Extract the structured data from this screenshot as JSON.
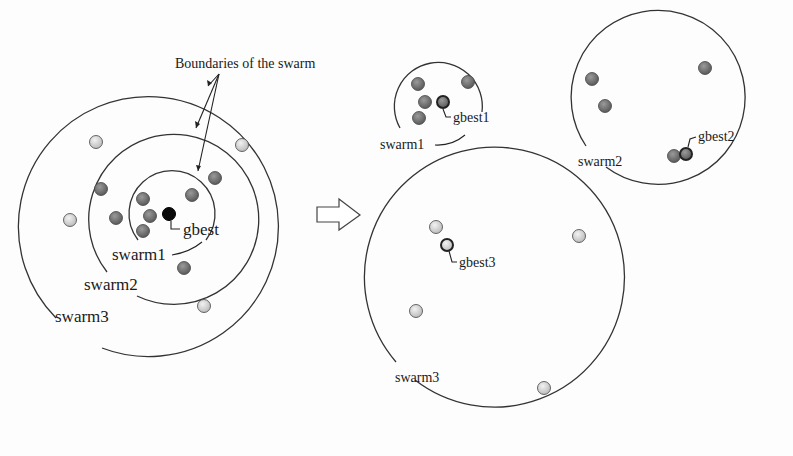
{
  "figure": {
    "colors": {
      "swarm1_particle": "#6e6e6e",
      "swarm2_particle": "#7a7a7a",
      "swarm3_particle": "#d4d4d4",
      "gbest": "#0a0a0a",
      "line": "#333333"
    },
    "left": {
      "annotation": "Boundaries of the swarm",
      "gbest_label": "gbest",
      "rings": [
        {
          "name": "swarm1",
          "label": "swarm1",
          "cx": 165,
          "cy": 215,
          "r": 43
        },
        {
          "name": "swarm2",
          "label": "swarm2",
          "cx": 165,
          "cy": 225,
          "r": 85
        },
        {
          "name": "swarm3",
          "label": "swarm3",
          "cx": 165,
          "cy": 235,
          "r": 130
        }
      ],
      "particles": [
        {
          "swarm": "swarm1",
          "x": 143,
          "y": 199
        },
        {
          "swarm": "swarm1",
          "x": 150,
          "y": 216
        },
        {
          "swarm": "swarm1",
          "x": 143,
          "y": 231
        },
        {
          "swarm": "swarm1",
          "x": 192,
          "y": 195
        },
        {
          "swarm": "swarm2",
          "x": 101,
          "y": 189
        },
        {
          "swarm": "swarm2",
          "x": 116,
          "y": 218
        },
        {
          "swarm": "swarm2",
          "x": 215,
          "y": 178
        },
        {
          "swarm": "swarm2",
          "x": 184,
          "y": 268
        },
        {
          "swarm": "swarm3",
          "x": 96,
          "y": 142
        },
        {
          "swarm": "swarm3",
          "x": 242,
          "y": 145
        },
        {
          "swarm": "swarm3",
          "x": 70,
          "y": 220
        },
        {
          "swarm": "swarm3",
          "x": 204,
          "y": 306
        }
      ],
      "gbest": {
        "x": 169,
        "y": 214
      }
    },
    "arrow": {
      "direction": "right"
    },
    "right": {
      "swarms": [
        {
          "name": "swarm1",
          "label": "swarm1",
          "gbest_label": "gbest1",
          "cx": 438,
          "cy": 107,
          "r": 44,
          "particles": [
            {
              "x": 418,
              "y": 84
            },
            {
              "x": 468,
              "y": 82
            },
            {
              "x": 425,
              "y": 102
            },
            {
              "x": 419,
              "y": 118
            }
          ],
          "gbest": {
            "x": 443,
            "y": 102
          }
        },
        {
          "name": "swarm2",
          "label": "swarm2",
          "gbest_label": "gbest2",
          "cx": 666,
          "cy": 101,
          "r": 87,
          "particles": [
            {
              "x": 592,
              "y": 79
            },
            {
              "x": 605,
              "y": 106
            },
            {
              "x": 705,
              "y": 68
            },
            {
              "x": 674,
              "y": 156
            }
          ],
          "gbest": {
            "x": 686,
            "y": 154
          }
        },
        {
          "name": "swarm3",
          "label": "swarm3",
          "gbest_label": "gbest3",
          "cx": 509,
          "cy": 290,
          "r": 130,
          "particles": [
            {
              "x": 436,
              "y": 227
            },
            {
              "x": 579,
              "y": 236
            },
            {
              "x": 416,
              "y": 311
            },
            {
              "x": 544,
              "y": 388
            }
          ],
          "gbest": {
            "x": 447,
            "y": 245
          }
        }
      ]
    }
  }
}
